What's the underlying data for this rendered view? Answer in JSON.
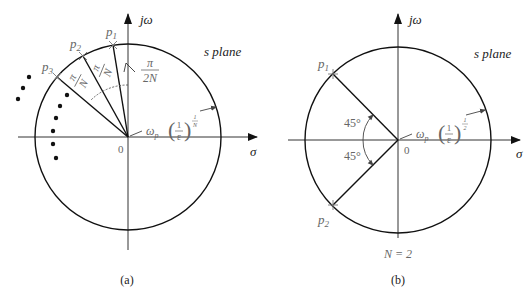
{
  "panels": [
    {
      "id": "a",
      "caption": "(a)",
      "plane_label": "s plane",
      "axis_x_label": "σ",
      "axis_y_label": "jω",
      "origin_label": "0",
      "poles": [
        {
          "label": "p",
          "sub": "1"
        },
        {
          "label": "p",
          "sub": "2"
        },
        {
          "label": "p",
          "sub": "3"
        }
      ],
      "angle_labels": [
        {
          "num": "π",
          "den": "N"
        },
        {
          "num": "π",
          "den": "N"
        },
        {
          "num": "π",
          "den": "2N"
        }
      ],
      "radius_label": {
        "base": "ω",
        "base_sub": "p",
        "frac_num": "1",
        "frac_den": "ε",
        "exp_num": "1",
        "exp_den": "N"
      }
    },
    {
      "id": "b",
      "caption": "(b)",
      "plane_label": "s plane",
      "axis_x_label": "σ",
      "axis_y_label": "jω",
      "origin_label": "0",
      "order_label": "N = 2",
      "poles": [
        {
          "label": "p",
          "sub": "1"
        },
        {
          "label": "p",
          "sub": "2"
        }
      ],
      "angle_labels": [
        "45°",
        "45°"
      ],
      "radius_label": {
        "base": "ω",
        "base_sub": "p",
        "frac_num": "1",
        "frac_den": "ε",
        "exp_num": "1",
        "exp_den": "2"
      }
    }
  ]
}
